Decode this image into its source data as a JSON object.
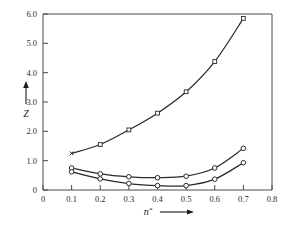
{
  "chart_data": {
    "type": "line",
    "title": "",
    "subtitle": "",
    "xlabel": "n*",
    "ylabel": "Z",
    "xlim": [
      0,
      0.8
    ],
    "ylim": [
      0,
      6.0
    ],
    "xticks": [
      "0",
      "0.1",
      "0.2",
      "0.3",
      "0.4",
      "0.5",
      "0.6",
      "0.7",
      "0.8"
    ],
    "xtick_values": [
      0,
      0.1,
      0.2,
      0.3,
      0.4,
      0.5,
      0.6,
      0.7,
      0.8
    ],
    "yticks": [
      "0",
      "1.0",
      "2.0",
      "3.0",
      "4.0",
      "5.0",
      "6.0"
    ],
    "ytick_values": [
      0,
      1.0,
      2.0,
      3.0,
      4.0,
      5.0,
      6.0
    ],
    "grid": false,
    "legend": "none",
    "x": [
      0.1,
      0.2,
      0.3,
      0.4,
      0.5,
      0.6,
      0.7
    ],
    "series": [
      {
        "name": "upper-curve",
        "marker": "x",
        "values": [
          1.25,
          1.55,
          2.05,
          2.62,
          3.35,
          4.38,
          5.85
        ]
      },
      {
        "name": "middle-curve",
        "marker": "circle",
        "values": [
          0.75,
          0.55,
          0.45,
          0.42,
          0.47,
          0.75,
          1.42
        ]
      },
      {
        "name": "lower-curve",
        "marker": "circle",
        "values": [
          0.62,
          0.38,
          0.22,
          0.15,
          0.15,
          0.37,
          0.93
        ]
      }
    ],
    "annotations": {
      "y_axis_arrow": "up",
      "x_axis_arrow": "right"
    },
    "colors": {
      "curve": "#2a2a2a",
      "axis": "#4a4a4a",
      "text": "#1a1a1a",
      "background": "#ffffff"
    }
  }
}
